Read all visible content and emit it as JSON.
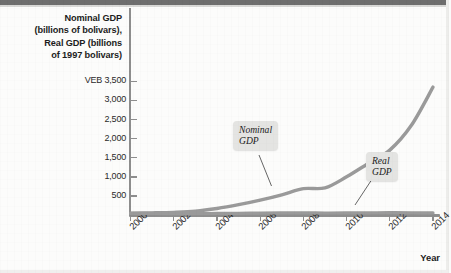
{
  "chart_data": {
    "type": "line",
    "title": "Nominal GDP (billions of bolivars), Real GDP (billions of 1997 bolivars)",
    "title_lines": [
      "Nominal GDP",
      "(billions of bolivars),",
      "Real GDP (billions",
      "of 1997 bolivars)"
    ],
    "xlabel": "Year",
    "ylabel": "",
    "y_unit_prefix": "VEB",
    "ylim": [
      0,
      3500
    ],
    "xlim": [
      2000,
      2014
    ],
    "grid": false,
    "legend": "annotations",
    "y_ticks": [
      3500,
      3000,
      2500,
      2000,
      1500,
      1000,
      500
    ],
    "y_tick_labels": [
      "VEB 3,500",
      "3,000",
      "2,500",
      "2,000",
      "1,500",
      "1,000",
      "500"
    ],
    "x_ticks": [
      2000,
      2002,
      2004,
      2006,
      2008,
      2010,
      2012,
      2014
    ],
    "x_tick_labels": [
      "2000",
      "2002",
      "2004",
      "2006",
      "2008",
      "2010",
      "2012",
      "2014"
    ],
    "x": [
      2000,
      2001,
      2002,
      2003,
      2004,
      2005,
      2006,
      2007,
      2008,
      2009,
      2010,
      2011,
      2012,
      2013,
      2014
    ],
    "series": [
      {
        "name": "Nominal GDP",
        "color": "#9a9a9a",
        "values": [
          45,
          55,
          70,
          100,
          170,
          270,
          390,
          530,
          690,
          710,
          1000,
          1350,
          1700,
          2350,
          3350
        ]
      },
      {
        "name": "Real GDP",
        "color": "#9a9a9a",
        "values": [
          42,
          40,
          37,
          34,
          40,
          45,
          50,
          54,
          56,
          53,
          54,
          57,
          60,
          59,
          55
        ]
      }
    ],
    "annotations": [
      {
        "text_lines": [
          "Nominal",
          "GDP"
        ],
        "text": "Nominal GDP",
        "target_year": 2008
      },
      {
        "text_lines": [
          "Real",
          "GDP"
        ],
        "text": "Real GDP",
        "target_year": 2011
      }
    ]
  }
}
